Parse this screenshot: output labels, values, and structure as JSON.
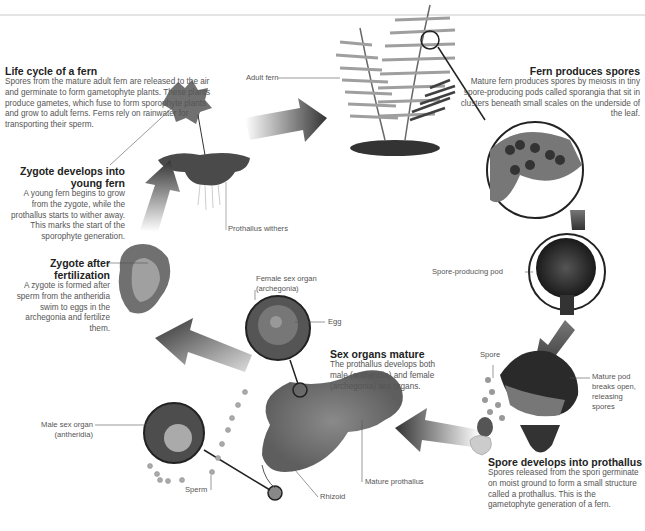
{
  "diagram": {
    "title": "Life cycle of a fern",
    "intro": "Spores from the mature adult fern are released to the air and germinate to form gametophyte plants. These plants produce gametes, which fuse to form sporophyte plants and grow to adult ferns. Ferns rely on rainwater for transporting their sperm.",
    "colors": {
      "arrow_dark": "#333333",
      "outline": "#222222",
      "plant": "#6f6f6f",
      "text": "#555555"
    },
    "stages": [
      {
        "id": "fern-produces-spores",
        "title": "Fern produces spores",
        "text": "Mature fern produces spores by meiosis in tiny spore-producing pods called sporangia that sit in clusters beneath small scales on the underside of the leaf."
      },
      {
        "id": "spore-develops",
        "title": "Spore develops into prothallus",
        "text": "Spores released from the spori germinate on moist ground to form a small structure called a prothallus. This is the gametophyte generation of a fern."
      },
      {
        "id": "sex-organs-mature",
        "title": "Sex organs mature",
        "text": "The prothallus develops both male (antheridia) and female (archegonia) sex organs."
      },
      {
        "id": "zygote-after-fertilization",
        "title": "Zygote after fertilization",
        "text": "A zygote is formed after sperm from the antheridia swim to eggs in the archegonia and fertilize them."
      },
      {
        "id": "zygote-develops",
        "title": "Zygote develops into young fern",
        "text": "A young fern begins to grow from the zygote, while the prothallus starts to wither away. This marks the start of the sporophyte generation."
      }
    ],
    "labels": {
      "adult_fern": "Adult fern",
      "prothallus_withers": "Prothallus withers",
      "spore_pod": "Spore-producing pod",
      "spore": "Spore",
      "mature_pod": "Mature pod breaks open, releasing spores",
      "female_organ": "Female sex organ (archegonia)",
      "egg": "Egg",
      "male_organ": "Male sex organ (antheridia)",
      "sperm": "Sperm",
      "rhizoid": "Rhizoid",
      "mature_prothallus": "Mature prothallus"
    }
  }
}
